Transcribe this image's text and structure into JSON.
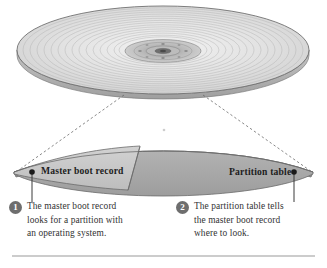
{
  "diagram": {
    "platter": {
      "icon": "disk-platter-icon",
      "hub_icon": "spindle-hub-icon",
      "track_count": 17
    },
    "band": {
      "segments": [
        {
          "id": "mbr",
          "label": "Master boot record",
          "fill": "#c9c9c9"
        },
        {
          "id": "partition-table",
          "label": "Partition table",
          "fill": "#a8a8a8"
        }
      ]
    },
    "markers": {
      "left_dot": "endpoint-dot",
      "right_dot": "endpoint-dot"
    },
    "callouts": [
      {
        "number": "1",
        "lines": [
          "The master boot record",
          "looks for a partition with",
          "an operating system."
        ]
      },
      {
        "number": "2",
        "lines": [
          "The partition table tells",
          "the master boot record",
          "where to look."
        ]
      }
    ],
    "colors": {
      "background": "#ffffff",
      "band_light": "#c9c9c9",
      "band_dark": "#a8a8a8",
      "outline": "#6b6b6b",
      "badge": "#6e6e6e",
      "text": "#333333",
      "rule": "#9a9a9a"
    }
  }
}
